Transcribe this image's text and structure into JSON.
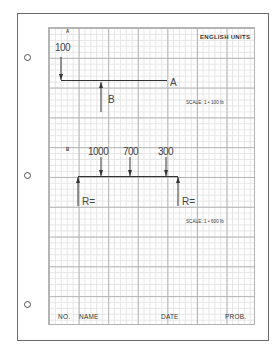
{
  "sheet": {
    "header": "ENGLISH UNITS",
    "footer": {
      "no_label": "NO.",
      "name_label": "NAME",
      "date_label": "DATE",
      "prob_label": "PROB."
    }
  },
  "problem_a": {
    "label": "A",
    "load_value": "100",
    "beam_end_label": "A",
    "reaction_label": "B",
    "scale": "SCALE: 1 • 100 lb"
  },
  "problem_b": {
    "label": "B",
    "loads": [
      "1000",
      "700",
      "300"
    ],
    "left_reaction_label": "R=",
    "right_reaction_label": "R=",
    "scale": "SCALE: 1 • 600 lb"
  },
  "colors": {
    "ink": "#333333",
    "grid_major": "#b4b4b4",
    "grid_minor": "#e6e6e6",
    "border": "#6a6a6a"
  }
}
